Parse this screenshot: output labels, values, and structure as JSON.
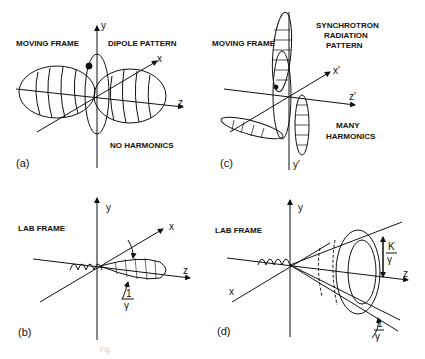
{
  "panels": {
    "a": {
      "tag": "(a)",
      "frame": "MOVING FRAME",
      "title": "DIPOLE PATTERN",
      "note": "NO HARMONICS",
      "axes": {
        "y": "y",
        "x": "x",
        "z": "z"
      }
    },
    "b": {
      "tag": "(b)",
      "frame": "LAB FRAME",
      "axes": {
        "y": "y",
        "x": "x",
        "z": "z"
      },
      "angle_num": "1",
      "angle_den": "γ"
    },
    "c": {
      "tag": "(c)",
      "frame": "MOVING FRAME",
      "title_line1": "SYNCHROTRON",
      "title_line2": "RADIATION",
      "title_line3": "PATTERN",
      "note_line1": "MANY",
      "note_line2": "HARMONICS",
      "axes": {
        "x": "x'",
        "z": "z'",
        "y": "y'"
      }
    },
    "d": {
      "tag": "(d)",
      "frame": "LAB FRAME",
      "axes": {
        "y": "y",
        "x": "x",
        "z": "z"
      },
      "cone_num": "K",
      "cone_den": "γ",
      "angle_num": "1",
      "angle_den": "γ"
    }
  },
  "caption": "Fig."
}
